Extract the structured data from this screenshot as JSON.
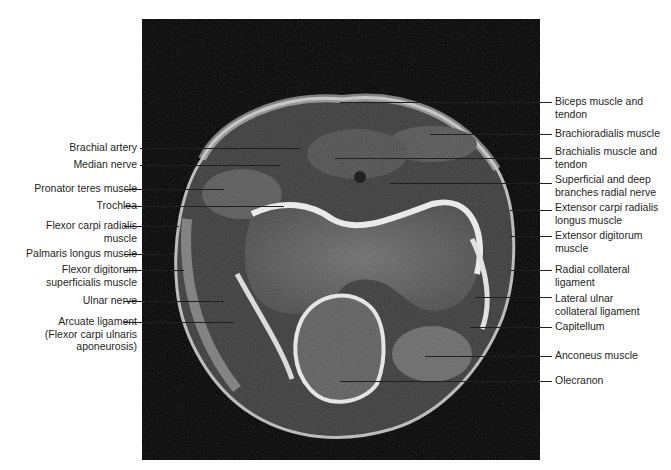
{
  "figure": {
    "image_bg": "#000000",
    "line_color": "#231f20"
  },
  "labels_left": [
    {
      "id": "brachial-artery",
      "text": "Brachial artery"
    },
    {
      "id": "median-nerve",
      "text": "Median nerve"
    },
    {
      "id": "pronator-teres",
      "text": "Pronator teres muscle"
    },
    {
      "id": "trochlea",
      "text": "Trochlea"
    },
    {
      "id": "flexor-carpi-radialis",
      "text": "Flexor carpi radialis\nmuscle"
    },
    {
      "id": "palmaris-longus",
      "text": "Palmaris longus muscle"
    },
    {
      "id": "flexor-digitorum-superficialis",
      "text": "Flexor digitorum\nsuperficialis muscle"
    },
    {
      "id": "ulnar-nerve",
      "text": "Ulnar nerve"
    },
    {
      "id": "arcuate-ligament",
      "text": "Arcuate ligament\n(Flexor carpi ulnaris\naponeurosis)"
    }
  ],
  "labels_right": [
    {
      "id": "biceps",
      "text": "Biceps muscle and\ntendon"
    },
    {
      "id": "brachioradialis",
      "text": "Brachioradialis muscle"
    },
    {
      "id": "brachialis",
      "text": "Brachialis muscle and\ntendon"
    },
    {
      "id": "radial-nerve",
      "text": "Superficial and deep\nbranches radial nerve"
    },
    {
      "id": "ecrl",
      "text": "Extensor carpi radialis\nlongus muscle"
    },
    {
      "id": "extensor-digitorum",
      "text": "Extensor digitorum\nmuscle"
    },
    {
      "id": "radial-collateral",
      "text": "Radial collateral\nligament"
    },
    {
      "id": "lateral-ulnar-collateral",
      "text": "Lateral ulnar\ncollateral ligament"
    },
    {
      "id": "capitellum",
      "text": "Capitellum"
    },
    {
      "id": "anconeus",
      "text": "Anconeus muscle"
    },
    {
      "id": "olecranon",
      "text": "Olecranon"
    }
  ]
}
